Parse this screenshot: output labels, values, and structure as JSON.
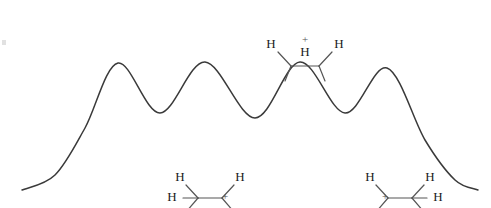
{
  "figure": {
    "background_color": "#ffffff",
    "curve_color": "#3a3a3a",
    "atom_label_color": "#1a1a1a",
    "bond_color": "#555555",
    "width": 491,
    "height": 208
  },
  "chart_data": {
    "type": "line",
    "title": "",
    "xlabel": "",
    "ylabel": "",
    "grid": false,
    "legend": null,
    "axis_visible": false,
    "xlim": [
      0,
      491
    ],
    "ylim": [
      0,
      208
    ],
    "series": [
      {
        "name": "potential-energy",
        "description": "Periodic rotational energy barrier curve with four maxima and three minima, tapering at both ends",
        "points": [
          {
            "x": 22,
            "y": 190,
            "role": "left-tail-end"
          },
          {
            "x": 55,
            "y": 175,
            "role": "left-rise"
          },
          {
            "x": 85,
            "y": 128,
            "role": "left-rise"
          },
          {
            "x": 118,
            "y": 63,
            "role": "maximum-1"
          },
          {
            "x": 160,
            "y": 113,
            "role": "minimum-1"
          },
          {
            "x": 205,
            "y": 62,
            "role": "maximum-2"
          },
          {
            "x": 255,
            "y": 118,
            "role": "minimum-2"
          },
          {
            "x": 300,
            "y": 62,
            "role": "maximum-3"
          },
          {
            "x": 345,
            "y": 113,
            "role": "minimum-3"
          },
          {
            "x": 387,
            "y": 68,
            "role": "maximum-4"
          },
          {
            "x": 425,
            "y": 140,
            "role": "right-fall"
          },
          {
            "x": 455,
            "y": 180,
            "role": "right-fall"
          },
          {
            "x": 478,
            "y": 190,
            "role": "right-tail-end"
          }
        ]
      }
    ]
  },
  "molecules": [
    {
      "id": "eclipsed-cation-top",
      "position": "above central maximum",
      "conformation": "eclipsed",
      "charge_symbol": "+",
      "labels": {
        "left_h": "H",
        "center_h": "H",
        "right_h": "H"
      }
    },
    {
      "id": "staggered-cation-left",
      "position": "below first valley region",
      "conformation": "staggered",
      "charge_symbol": "+",
      "charge_on": "right-carbon",
      "labels": {
        "top_left_h": "H",
        "mid_left_h": "H",
        "top_right_h": "H"
      }
    },
    {
      "id": "staggered-cation-right",
      "position": "below third valley region",
      "conformation": "staggered",
      "charge_symbol": "+",
      "charge_on": "left-carbon",
      "labels": {
        "top_left_h": "H",
        "top_right_h": "H",
        "mid_right_h": "H"
      }
    }
  ]
}
